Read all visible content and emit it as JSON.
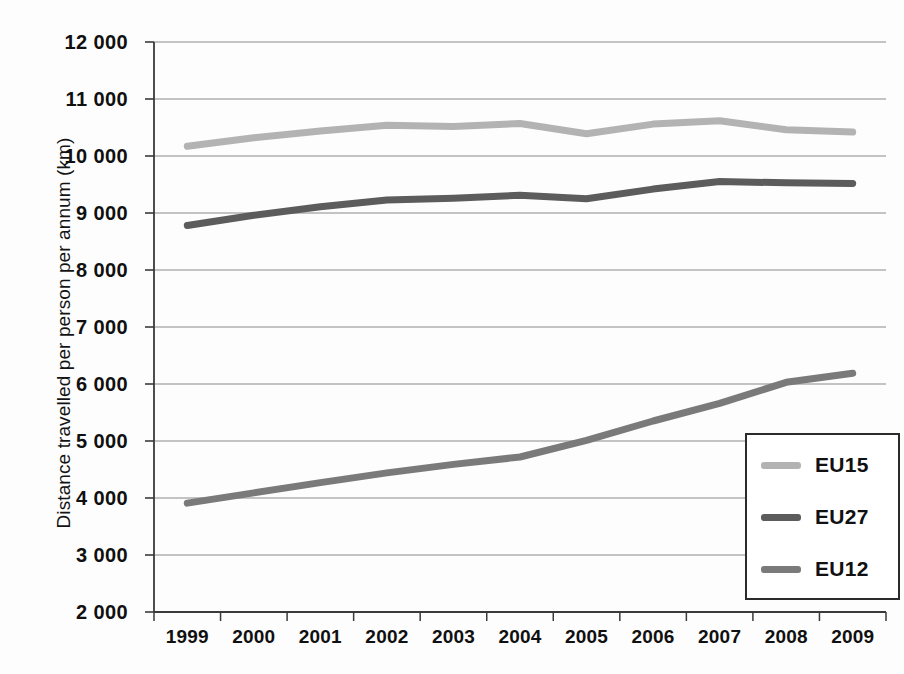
{
  "chart_data": {
    "type": "line",
    "title": "",
    "xlabel": "",
    "ylabel": "Distance travelled per person per annum (km)",
    "categories": [
      "1999",
      "2000",
      "2001",
      "2002",
      "2003",
      "2004",
      "2005",
      "2006",
      "2007",
      "2008",
      "2009"
    ],
    "ylim": [
      2000,
      12000
    ],
    "ytick_labels": [
      "12 000",
      "11 000",
      "10 000",
      "9 000",
      "8 000",
      "7 000",
      "6 000",
      "5 000",
      "4 000",
      "3 000",
      "2 000"
    ],
    "ytick_values": [
      12000,
      11000,
      10000,
      9000,
      8000,
      7000,
      6000,
      5000,
      4000,
      3000,
      2000
    ],
    "grid": true,
    "legend_position": "bottom-right",
    "series": [
      {
        "name": "EU15",
        "color": "#b3b3b3",
        "values": [
          10170,
          10320,
          10440,
          10540,
          10520,
          10570,
          10390,
          10560,
          10620,
          10460,
          10420
        ]
      },
      {
        "name": "EU27",
        "color": "#5c5c5c",
        "values": [
          8780,
          8960,
          9110,
          9230,
          9260,
          9310,
          9250,
          9420,
          9550,
          9530,
          9520
        ]
      },
      {
        "name": "EU12",
        "color": "#7a7a7a",
        "values": [
          3910,
          4090,
          4270,
          4440,
          4590,
          4720,
          5010,
          5350,
          5660,
          6030,
          6190
        ]
      }
    ]
  },
  "legend": {
    "entries": [
      {
        "label": "EU15",
        "color": "#b3b3b3"
      },
      {
        "label": "EU27",
        "color": "#5c5c5c"
      },
      {
        "label": "EU12",
        "color": "#7a7a7a"
      }
    ]
  },
  "axes": {
    "y_title": "Distance travelled per person per annum (km)"
  }
}
